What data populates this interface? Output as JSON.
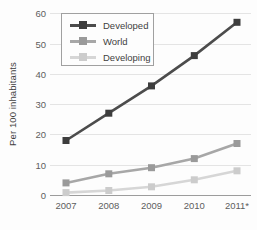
{
  "colors": {
    "background": "#fdfdfd",
    "grid": "#e4e4e4",
    "axis": "#9c9c9c",
    "tick_text": "#5d5d5d",
    "label_text": "#3f3f3f",
    "legend_border": "#a0a0a0",
    "legend_background": "#fdfdfd"
  },
  "chart_data": {
    "type": "line",
    "title": "",
    "xlabel": "",
    "ylabel": "Per 100 inhabitants",
    "categories": [
      "2007",
      "2008",
      "2009",
      "2010",
      "2011*"
    ],
    "series": [
      {
        "name": "Developed",
        "values": [
          18,
          27,
          36,
          46,
          57
        ],
        "color": "#4c4c4c",
        "marker_color": "#3d3d3d"
      },
      {
        "name": "World",
        "values": [
          4,
          7,
          9,
          12,
          17
        ],
        "color": "#a7a7a7",
        "marker_color": "#9a9a9a"
      },
      {
        "name": "Developing",
        "values": [
          0.8,
          1.5,
          2.7,
          5,
          8
        ],
        "color": "#d6d6d6",
        "marker_color": "#cccccc"
      }
    ],
    "ylim": [
      0,
      60
    ],
    "ytick_step": 10,
    "grid": true,
    "marker": "square",
    "legend_position": "top-left"
  }
}
